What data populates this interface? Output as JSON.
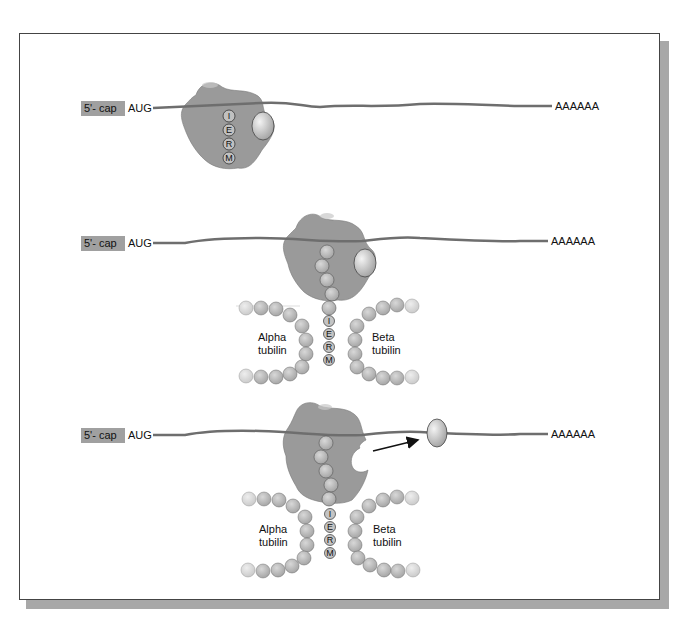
{
  "figure": {
    "type": "diagram"
  },
  "panels": [
    {
      "cap_label": "5'- cap",
      "start_codon": "AUG",
      "polyA": "AAAAAA",
      "peptide_letters": [
        "I",
        "E",
        "R",
        "M"
      ]
    },
    {
      "cap_label": "5'- cap",
      "start_codon": "AUG",
      "polyA": "AAAAAA",
      "peptide_letters": [
        "I",
        "E",
        "R",
        "M"
      ],
      "left_label_1": "Alpha",
      "left_label_2": "tubilin",
      "right_label_1": "Beta",
      "right_label_2": "tubilin"
    },
    {
      "cap_label": "5'- cap",
      "start_codon": "AUG",
      "polyA": "AAAAAA",
      "peptide_letters": [
        "I",
        "E",
        "R",
        "M"
      ],
      "left_label_1": "Alpha",
      "left_label_2": "tubilin",
      "right_label_1": "Beta",
      "right_label_2": "tubilin"
    }
  ],
  "colors": {
    "mrna": "#6e6e6e",
    "ribosome": "#9a9a9a",
    "cap_bg": "#a0a0a0",
    "bead": "#b8b8b8",
    "frame_shadow": "#a8a8a8"
  }
}
